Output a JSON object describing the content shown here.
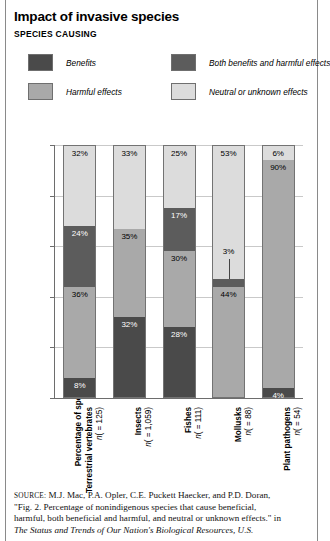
{
  "header": {
    "title": "Impact of invasive species",
    "subtitle": "SPECIES CAUSING"
  },
  "legend": {
    "items": [
      {
        "label": "Benefits",
        "color": "#4a4a4a"
      },
      {
        "label": "Both benefits and harmful effects",
        "color": "#5c5c5c"
      },
      {
        "label": "Harmful effects",
        "color": "#a9a9a9"
      },
      {
        "label": "Neutral or unknown effects",
        "color": "#dcdcdc"
      }
    ]
  },
  "chart_data": {
    "type": "bar",
    "title": "Impact of invasive species",
    "subtitle": "SPECIES CAUSING",
    "stacked": true,
    "xlabel": "",
    "ylabel": "Percentage of species analyzed",
    "ylim": [
      0,
      100
    ],
    "yticks": [
      0,
      20,
      40,
      60,
      80,
      100
    ],
    "grid": true,
    "legend_position": "top",
    "categories": [
      "Terrestrial vertebrates (n = 125)",
      "Insects (n = 1,059)",
      "Fishes (n = 111)",
      "Mollusks (n = 88)",
      "Plant pathogens (n = 54)"
    ],
    "category_names": [
      "Terrestrial vertebrates",
      "Insects",
      "Fishes",
      "Mollusks",
      "Plant pathogens"
    ],
    "category_counts": [
      "(n = 125)",
      "(n = 1,059)",
      "(n = 111)",
      "(n = 88)",
      "(n = 54)"
    ],
    "series": [
      {
        "name": "Benefits",
        "color": "#4a4a4a",
        "values": [
          8,
          32,
          28,
          0,
          4
        ],
        "labels": [
          "8%",
          "32%",
          "28%",
          "",
          "4%"
        ]
      },
      {
        "name": "Harmful effects",
        "color": "#a9a9a9",
        "values": [
          36,
          35,
          30,
          44,
          90
        ],
        "labels": [
          "36%",
          "35%",
          "30%",
          "44%",
          "90%"
        ]
      },
      {
        "name": "Both benefits and harmful effects",
        "color": "#5c5c5c",
        "values": [
          24,
          0,
          17,
          3,
          0
        ],
        "labels": [
          "24%",
          "",
          "17%",
          "3%",
          ""
        ]
      },
      {
        "name": "Neutral or unknown effects",
        "color": "#dcdcdc",
        "values": [
          32,
          33,
          25,
          53,
          6
        ],
        "labels": [
          "32%",
          "33%",
          "25%",
          "53%",
          "6%"
        ]
      }
    ],
    "annotations": [
      {
        "text": "3%",
        "category": "Mollusks",
        "series": "Both benefits and harmful effects",
        "leader_line": true
      }
    ]
  },
  "axis": {
    "y_tick_labels": [
      "100",
      "80",
      "60",
      "40",
      "20",
      "0"
    ]
  },
  "source": {
    "prefix": "SOURCE:",
    "line1": " M.J. Mac, P.A. Opler, C.E. Puckett Haecker, and P.D. Doran,",
    "line2": "\"Fig. 2. Percentage of nonindigenous species that cause beneficial,",
    "line3": "harmful, both beneficial and harmful, and neutral or unknown effects.\" in",
    "line4": "The Status and Trends of Our Nation's Biological Resources, U.S."
  }
}
